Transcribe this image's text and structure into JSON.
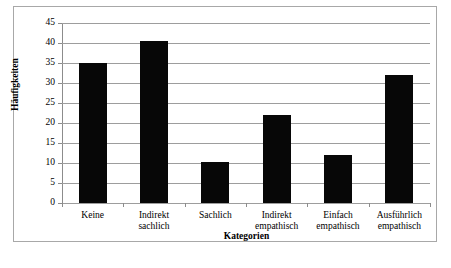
{
  "chart_data": {
    "type": "bar",
    "title": "",
    "xlabel": "Kategorien",
    "ylabel": "Häufigkeiten",
    "categories": [
      "Keine",
      "Indirekt sachlich",
      "Sachlich",
      "Indirekt empathisch",
      "Einfach empathisch",
      "Ausführlich empathisch"
    ],
    "category_lines": [
      [
        "Keine"
      ],
      [
        "Indirekt",
        "sachlich"
      ],
      [
        "Sachlich"
      ],
      [
        "Indirekt",
        "empathisch"
      ],
      [
        "Einfach",
        "empathisch"
      ],
      [
        "Ausführlich",
        "empathisch"
      ]
    ],
    "values": [
      35,
      40.5,
      10.3,
      22,
      12,
      32
    ],
    "ylim": [
      0,
      45
    ],
    "ytick_values": [
      0,
      5,
      10,
      15,
      20,
      25,
      30,
      35,
      40,
      45
    ],
    "ytick_labels": [
      "0",
      "5",
      "10",
      "15",
      "20",
      "25",
      "30",
      "35",
      "40",
      "45"
    ],
    "grid": true,
    "grid_axis": "y",
    "legend": false,
    "legend_position": "none",
    "bar_color": "#070707",
    "gridline_color": "#9d9d9d",
    "axis_color": "#8c8c8c",
    "border_color": "#a8a8a8",
    "background_color": "#ffffff"
  }
}
